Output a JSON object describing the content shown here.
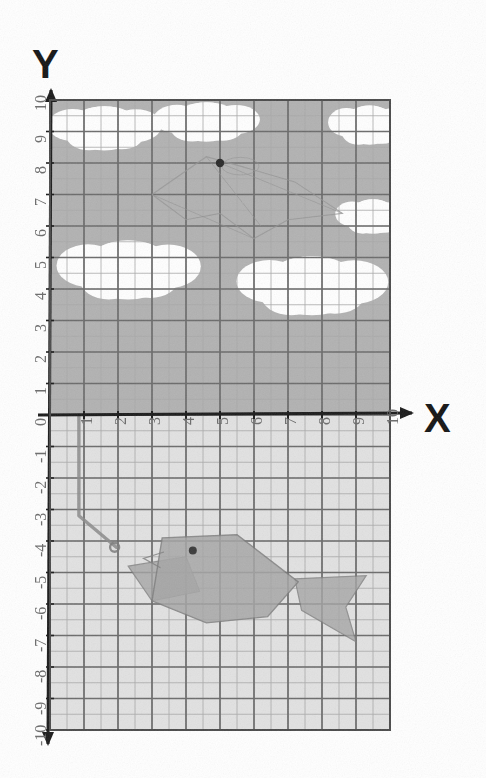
{
  "axes": {
    "x_label": "X",
    "y_label": "Y",
    "x_ticks": [
      "0",
      "1",
      "2",
      "3",
      "4",
      "5",
      "6",
      "7",
      "8",
      "9",
      "10"
    ],
    "y_ticks_positive": [
      "1",
      "2",
      "3",
      "4",
      "5",
      "6",
      "7",
      "8",
      "9",
      "10"
    ],
    "y_ticks_negative": [
      "-1",
      "-2",
      "-3",
      "-4",
      "-5",
      "-6",
      "-7",
      "-8",
      "-9",
      "-10"
    ],
    "x_range": [
      0,
      10
    ],
    "y_range": [
      -10,
      10
    ],
    "origin_label": "0"
  },
  "colors": {
    "sky": "#b2b2b2",
    "water": "#e2e2e2",
    "cloud": "#ffffff",
    "major_grid": "#6b6b6b",
    "minor_grid": "#a8a8a8",
    "axis": "#1a1a1a",
    "fish_body": "#a6a6a6",
    "fish_outline": "#7d7d7d",
    "bird_outline": "#949494",
    "tick_text": "#6f6f6f",
    "paper": "#ffffff"
  },
  "chart_data": {
    "type": "scatter",
    "title": "",
    "xlabel": "X",
    "ylabel": "Y",
    "xlim": [
      0,
      10
    ],
    "ylim": [
      -10,
      10
    ],
    "grid": true,
    "major_grid_step": 1,
    "minor_grid_step": 0.5,
    "legend": "none",
    "categories": [],
    "values": [],
    "annotations": [
      {
        "name": "bird-eye-point",
        "x": 5.0,
        "y": 8.0,
        "label": ""
      },
      {
        "name": "fish-eye-point",
        "x": 4.2,
        "y": -4.3,
        "label": ""
      },
      {
        "name": "hook-point",
        "x": 1.9,
        "y": -4.2,
        "label": ""
      }
    ],
    "regions": [
      {
        "name": "sky",
        "y_from": 0,
        "y_to": 10,
        "fill": "#b2b2b2"
      },
      {
        "name": "water",
        "y_from": -10,
        "y_to": 0,
        "fill": "#e2e2e2"
      }
    ]
  },
  "artwork": {
    "clouds": [
      {
        "name": "cloud-top-left",
        "cx": 1.6,
        "cy": 9.1,
        "rx": 1.5,
        "ry": 0.9
      },
      {
        "name": "cloud-top-mid",
        "cx": 4.6,
        "cy": 9.3,
        "rx": 1.4,
        "ry": 0.8
      },
      {
        "name": "cloud-top-right",
        "cx": 9.4,
        "cy": 9.2,
        "rx": 1.1,
        "ry": 0.8
      },
      {
        "name": "cloud-mid-left",
        "cx": 2.3,
        "cy": 4.6,
        "rx": 1.9,
        "ry": 1.2
      },
      {
        "name": "cloud-mid-right",
        "cx": 7.7,
        "cy": 4.1,
        "rx": 2.0,
        "ry": 1.2
      },
      {
        "name": "cloud-right-high",
        "cx": 9.5,
        "cy": 6.3,
        "rx": 1.0,
        "ry": 0.7
      }
    ],
    "bird": {
      "name": "bird-kite-outline",
      "eye": {
        "x": 5.0,
        "y": 8.0
      },
      "points": "3.0,7.0 4.6,8.2 5.6,7.9 7.2,7.4 8.6,6.4 7.0,6.2 6.0,5.6 5.0,6.4 4.0,6.2 3.0,7.0"
    },
    "fish": {
      "name": "fish-shape",
      "eye": {
        "x": 4.2,
        "y": -4.3
      },
      "body_points": "3.3,-3.9 5.5,-3.8 7.3,-5.3 6.4,-6.4 4.6,-6.6 3.0,-5.9 3.3,-3.9",
      "tail_points": "7.2,-5.2 9.3,-5.1 8.7,-6.1 9.0,-7.2 7.4,-6.2 7.2,-5.2",
      "fin_points": "2.3,-4.8 4.0,-4.5 4.4,-5.6 3.0,-5.9 2.3,-4.8"
    },
    "fishing_line": {
      "name": "fishing-line",
      "points": "0.85,0 0.85,-3.2 1.95,-4.2"
    }
  }
}
